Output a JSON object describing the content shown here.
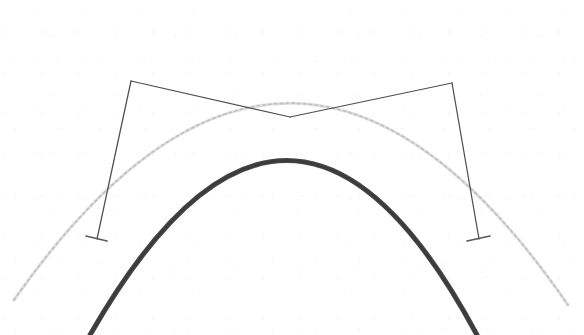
{
  "document": {
    "kind": "scanned-technical-line-drawing",
    "background_color": "#ffffff",
    "width": 584,
    "height": 335,
    "caption": ""
  },
  "palette": {
    "paper": "#ffffff",
    "dark_stroke": "#3a3a3a",
    "mid_stroke": "#4f4f4f",
    "faint_stroke": "#c9c9c9"
  },
  "chart_data": {
    "type": "scatter",
    "title": "",
    "subtitle": "",
    "xlabel": "",
    "ylabel": "",
    "xlim": [
      0,
      584
    ],
    "ylim": [
      335,
      0
    ],
    "grid": false,
    "legend": null,
    "annotations": [],
    "tick_labels": {
      "x": [],
      "y": []
    },
    "geometry_note": "Two nested circular arcs (dome profiles) with a bow-tie construction of four straight lines crossing at the inner arc apex; short horizontal tick marks terminate the two steep lines.",
    "elements": [
      {
        "name": "outer-arc-faint",
        "kind": "arc",
        "style": "faint",
        "apex": [
          292,
          22
        ],
        "left_end": [
          14,
          300
        ],
        "right_end": [
          568,
          305
        ],
        "path": "M 14 300 Q 292 -96 568 305"
      },
      {
        "name": "inner-arc-dark",
        "kind": "arc",
        "style": "bold",
        "apex": [
          290,
          117
        ],
        "left_end": [
          90,
          335
        ],
        "right_end": [
          477,
          335
        ],
        "path": "M 90 335 Q 290 -14 477 335"
      },
      {
        "name": "left-upper-chord",
        "kind": "line",
        "from": [
          131,
          81
        ],
        "to": [
          290,
          117
        ]
      },
      {
        "name": "right-upper-chord",
        "kind": "line",
        "from": [
          452,
          83
        ],
        "to": [
          290,
          117
        ]
      },
      {
        "name": "left-cross-chord",
        "kind": "line",
        "from": [
          290,
          117
        ],
        "to": [
          452,
          83
        ]
      },
      {
        "name": "left-steep-line",
        "kind": "line",
        "from": [
          131,
          81
        ],
        "to": [
          97,
          239
        ]
      },
      {
        "name": "right-steep-line",
        "kind": "line",
        "from": [
          452,
          83
        ],
        "to": [
          479,
          239
        ]
      },
      {
        "name": "left-tick",
        "kind": "tick",
        "at": [
          97,
          239
        ],
        "from": [
          86,
          236
        ],
        "to": [
          107,
          241
        ]
      },
      {
        "name": "right-tick",
        "kind": "tick",
        "at": [
          479,
          239
        ],
        "from": [
          467,
          241
        ],
        "to": [
          490,
          236
        ]
      }
    ],
    "vertices": [
      {
        "name": "left-apex-vertex",
        "x": 131,
        "y": 81
      },
      {
        "name": "right-apex-vertex",
        "x": 452,
        "y": 83
      },
      {
        "name": "crossing-point",
        "x": 290,
        "y": 117
      },
      {
        "name": "left-base-point",
        "x": 97,
        "y": 239
      },
      {
        "name": "right-base-point",
        "x": 479,
        "y": 239
      }
    ]
  }
}
